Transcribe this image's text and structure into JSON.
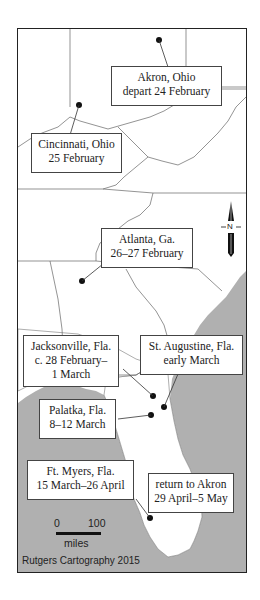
{
  "map": {
    "colors": {
      "land": "#ffffff",
      "water": "#b0b0b0",
      "border": "#555555",
      "frame": "#222222",
      "dot": "#111111"
    },
    "locations": [
      {
        "id": "akron",
        "lines": [
          "Akron, Ohio",
          "depart 24 February"
        ]
      },
      {
        "id": "cincinnati",
        "lines": [
          "Cincinnati, Ohio",
          "25 February"
        ]
      },
      {
        "id": "atlanta",
        "lines": [
          "Atlanta, Ga.",
          "26–27 February"
        ]
      },
      {
        "id": "jacksonville",
        "lines": [
          "Jacksonville, Fla.",
          "c. 28 February–",
          "1 March"
        ]
      },
      {
        "id": "st-augustine",
        "lines": [
          "St. Augustine, Fla.",
          "early March"
        ]
      },
      {
        "id": "palatka",
        "lines": [
          "Palatka, Fla.",
          "8–12 March"
        ]
      },
      {
        "id": "ft-myers",
        "lines": [
          "Ft. Myers, Fla.",
          "15 March–26 April"
        ]
      },
      {
        "id": "return",
        "lines": [
          "return to Akron",
          "29 April–5 May"
        ]
      }
    ],
    "north_arrow": {
      "label": "N"
    },
    "scale_bar": {
      "min": "0",
      "max": "100",
      "unit": "miles"
    },
    "credit": "Rutgers Cartography 2015"
  }
}
